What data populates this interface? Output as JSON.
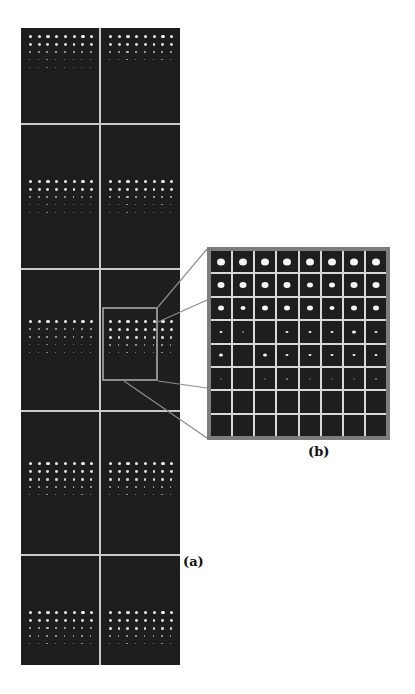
{
  "figure": {
    "panel_a": {
      "label": "(a)",
      "columns": 2,
      "rows": 5,
      "description": "Sequence of dark image panels each showing an 8-column array of bright spots with decreasing intensity down the rows",
      "panels": [
        {
          "row": 1,
          "col": 1,
          "dot_rows": [
            1.0,
            0.85,
            0.6,
            0.35,
            0.2
          ]
        },
        {
          "row": 1,
          "col": 2,
          "dot_rows": [
            1.0,
            0.85,
            0.65,
            0.4
          ]
        },
        {
          "row": 2,
          "col": 1,
          "dot_rows": [
            1.0,
            0.85,
            0.55,
            0.3,
            0.3
          ]
        },
        {
          "row": 2,
          "col": 2,
          "dot_rows": [
            1.0,
            0.85,
            0.65,
            0.4,
            0.3
          ]
        },
        {
          "row": 3,
          "col": 1,
          "dot_rows": [
            1.0,
            0.55,
            0.55,
            0.3,
            0.3
          ]
        },
        {
          "row": 3,
          "col": 2,
          "dot_rows": [
            1.0,
            0.9,
            0.75,
            0.45,
            0.4
          ],
          "highlighted": true
        },
        {
          "row": 4,
          "col": 1,
          "dot_rows": [
            1.0,
            0.85,
            0.75,
            0.55,
            0.4
          ]
        },
        {
          "row": 4,
          "col": 2,
          "dot_rows": [
            1.0,
            0.85,
            0.75,
            0.45,
            0.4
          ]
        },
        {
          "row": 5,
          "col": 1,
          "dot_rows": [
            1.0,
            0.85,
            0.65,
            0.45,
            0.4
          ]
        },
        {
          "row": 5,
          "col": 2,
          "dot_rows": [
            1.0,
            0.85,
            0.75,
            0.45,
            0.4
          ]
        }
      ]
    },
    "panel_b": {
      "label": "(b)",
      "grid": "8x8",
      "description": "Magnified view of highlighted region: 8x8 grid of spots, size decreasing by row",
      "spot_sizes": [
        [
          8,
          8,
          8,
          8,
          8,
          8,
          8,
          8
        ],
        [
          7,
          7,
          7,
          7,
          6,
          6,
          7,
          7
        ],
        [
          6,
          5,
          6,
          6,
          6,
          5,
          6,
          6
        ],
        [
          3,
          2,
          0,
          3,
          3,
          3,
          4,
          3
        ],
        [
          4,
          0,
          4,
          3,
          3,
          3,
          3,
          3
        ],
        [
          1,
          0,
          1,
          2,
          1,
          1,
          1,
          2
        ],
        [
          0,
          0,
          0,
          0,
          0,
          0,
          0,
          0
        ],
        [
          0,
          0,
          0,
          0,
          0,
          0,
          0,
          0
        ]
      ]
    },
    "colors": {
      "image_bg": "#1e1e1e",
      "grid_line": "#c9c9c9",
      "zoom_box": "#8c8c8c",
      "spot": "#f2f2f2"
    }
  }
}
